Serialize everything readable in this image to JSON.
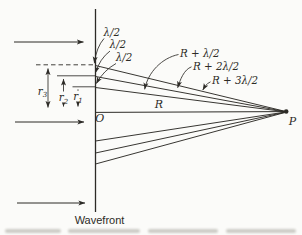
{
  "diagram": {
    "caption": "Wavefront",
    "origin_label": "O",
    "observation_point_label": "P",
    "axis_distance_label": "R",
    "half_wavelength_labels": [
      "λ/2",
      "λ/2",
      "λ/2"
    ],
    "path_length_labels": [
      "R + λ/2",
      "R + 2λ/2",
      "R + 3λ/2"
    ],
    "zone_radius_labels": [
      {
        "base": "r",
        "sub": "1"
      },
      {
        "base": "r",
        "sub": "2"
      },
      {
        "base": "r",
        "sub": "3"
      }
    ],
    "colors": {
      "ink": "#2d2b27",
      "paper": "#fbfbf9"
    }
  }
}
